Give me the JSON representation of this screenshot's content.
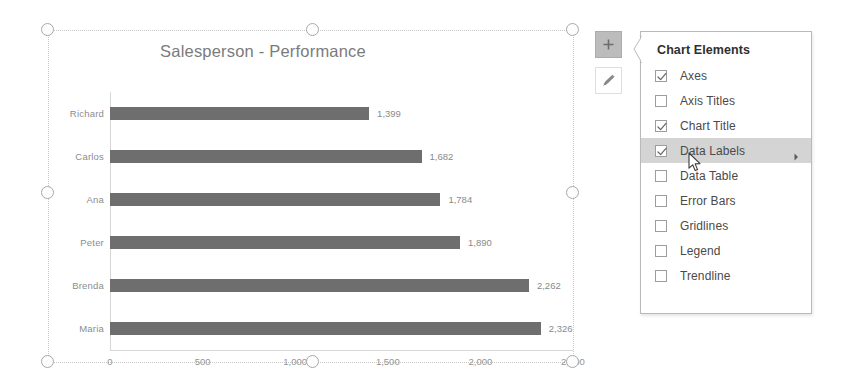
{
  "chart_object": {
    "selected": true,
    "handle_name": "resize-handle"
  },
  "chart_data": {
    "type": "bar",
    "orientation": "horizontal",
    "title": "Salesperson - Performance",
    "xlabel": "",
    "ylabel": "",
    "categories": [
      "Richard",
      "Carlos",
      "Ana",
      "Peter",
      "Brenda",
      "Maria"
    ],
    "values": [
      1399,
      1682,
      1784,
      1890,
      2262,
      2326
    ],
    "data_labels": [
      "1,399",
      "1,682",
      "1,784",
      "1,890",
      "2,262",
      "2,326"
    ],
    "xticks": [
      0,
      500,
      1000,
      1500,
      2000,
      2500
    ],
    "xtick_labels": [
      "0",
      "500",
      "1,000",
      "1,500",
      "2,000",
      "2,500"
    ],
    "xlim": [
      0,
      2500
    ],
    "grid": false,
    "legend": false,
    "series": [
      {
        "name": "Performance",
        "values": [
          1399,
          1682,
          1784,
          1890,
          2262,
          2326
        ],
        "color": "#6e6e6e"
      }
    ]
  },
  "float_buttons": [
    {
      "name": "chart-elements-button",
      "icon": "plus-icon",
      "active": true
    },
    {
      "name": "chart-styles-button",
      "icon": "paintbrush-icon",
      "active": false
    }
  ],
  "chart_elements_panel": {
    "title": "Chart Elements",
    "items": [
      {
        "label": "Axes",
        "checked": true,
        "highlighted": false,
        "submenu": false
      },
      {
        "label": "Axis Titles",
        "checked": false,
        "highlighted": false,
        "submenu": false
      },
      {
        "label": "Chart Title",
        "checked": true,
        "highlighted": false,
        "submenu": false
      },
      {
        "label": "Data Labels",
        "checked": true,
        "highlighted": true,
        "submenu": true
      },
      {
        "label": "Data Table",
        "checked": false,
        "highlighted": false,
        "submenu": false
      },
      {
        "label": "Error Bars",
        "checked": false,
        "highlighted": false,
        "submenu": false
      },
      {
        "label": "Gridlines",
        "checked": false,
        "highlighted": false,
        "submenu": false
      },
      {
        "label": "Legend",
        "checked": false,
        "highlighted": false,
        "submenu": false
      },
      {
        "label": "Trendline",
        "checked": false,
        "highlighted": false,
        "submenu": false
      }
    ]
  },
  "colors": {
    "bar": "#6e6e6e",
    "title_text": "#7b7b7b",
    "axis_text": "#949494",
    "highlight": "#d4d4d4",
    "panel_border": "#b9b9b9"
  }
}
